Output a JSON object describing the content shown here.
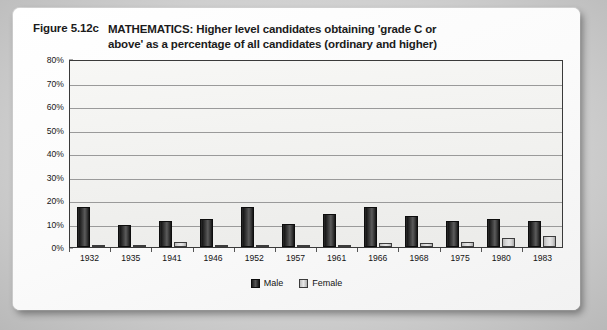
{
  "figure": {
    "label": "Figure 5.12c",
    "title_line1": "MATHEMATICS: Higher level candidates obtaining 'grade C or",
    "title_line2": "above' as a percentage of all candidates (ordinary and higher)"
  },
  "chart_data": {
    "type": "bar",
    "title": "MATHEMATICS: Higher level candidates obtaining 'grade C or above' as a percentage of all candidates (ordinary and higher)",
    "xlabel": "",
    "ylabel": "",
    "ylim": [
      0,
      80
    ],
    "ytick_labels": [
      "80%",
      "70%",
      "60%",
      "50%",
      "40%",
      "30%",
      "20%",
      "10%",
      "0%"
    ],
    "ytick_values": [
      80,
      70,
      60,
      50,
      40,
      30,
      20,
      10,
      0
    ],
    "grid": "horizontal",
    "legend_position": "bottom-center",
    "categories": [
      "1932",
      "1935",
      "1941",
      "1946",
      "1952",
      "1957",
      "1961",
      "1966",
      "1968",
      "1975",
      "1980",
      "1983"
    ],
    "series": [
      {
        "name": "Male",
        "color": "#2a2a2a",
        "values": [
          17,
          9.5,
          11,
          12,
          17,
          10,
          14,
          17,
          13,
          11,
          12,
          11
        ]
      },
      {
        "name": "Female",
        "color": "#d6d6d6",
        "values": [
          1,
          1,
          2,
          1,
          1,
          0.5,
          1,
          1.5,
          1.5,
          2,
          4,
          4.5
        ]
      }
    ]
  },
  "legend": {
    "items": [
      {
        "label": "Male"
      },
      {
        "label": "Female"
      }
    ]
  }
}
